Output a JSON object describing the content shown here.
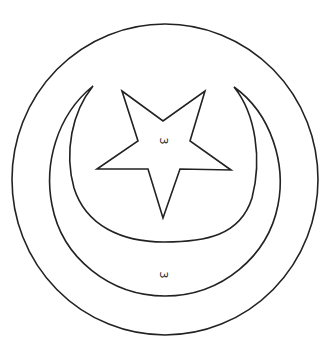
{
  "figure": {
    "type": "color-by-number outline",
    "stroke_color": "#222222",
    "background_color": "#ffffff",
    "outer_circle": {
      "cx": 165,
      "cy": 179.5,
      "rx": 153,
      "ry": 155.5
    },
    "crescent": {
      "outer_arc": {
        "left_x": 49,
        "right_x": 281,
        "bottom_y": 296,
        "tip_left": [
          93,
          86
        ],
        "tip_right": [
          234,
          87
        ]
      },
      "inner_arc": {
        "left_x": 71,
        "right_x": 257,
        "bottom_y": 242
      }
    },
    "star_points": [
      [
        122,
        91
      ],
      [
        163,
        121
      ],
      [
        205,
        91
      ],
      [
        190,
        141
      ],
      [
        231,
        170
      ],
      [
        180,
        169
      ],
      [
        163,
        218
      ],
      [
        148,
        169
      ],
      [
        97,
        169
      ],
      [
        138,
        141
      ]
    ]
  },
  "labels": {
    "star": "3",
    "crescent": "3"
  }
}
